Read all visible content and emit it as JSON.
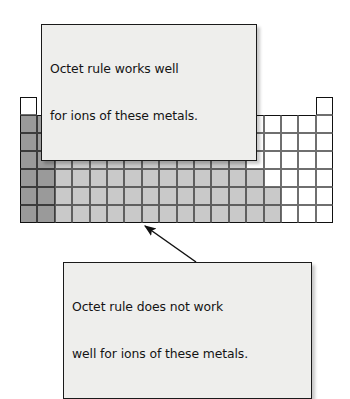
{
  "figure": {
    "background_color": "#ffffff"
  },
  "callouts": {
    "top": {
      "name": "octet-works-callout",
      "line1": "Octet rule works well",
      "line2": "for ions of these metals.",
      "fill_color": "#eeeeec",
      "border_color": "#1a1a1a",
      "text_color": "#141414"
    },
    "bottom": {
      "name": "octet-does-not-work-callout",
      "line1": "Octet rule does not work",
      "line2": "well for ions of these metals.",
      "fill_color": "#eeeeec",
      "border_color": "#1a1a1a",
      "text_color": "#141414"
    }
  },
  "arrows": [
    {
      "name": "arrow-to-group2",
      "from_callout": "top",
      "points_to": "group-2-alkaline-earth-metals",
      "x1": 94,
      "y1": 80,
      "x2": 52,
      "y2": 110,
      "color": "#111111"
    },
    {
      "name": "arrow-to-aluminum",
      "from_callout": "top",
      "points_to": "group-13-aluminum-cell",
      "x1": 182,
      "y1": 80,
      "x2": 229,
      "y2": 130,
      "color": "#111111"
    },
    {
      "name": "arrow-to-transition-metals",
      "from_callout": "bottom",
      "points_to": "transition-metals-block",
      "x1": 196,
      "y1": 262,
      "x2": 145,
      "y2": 226,
      "color": "#111111"
    }
  ],
  "legend": {
    "dark_gray": {
      "color": "#9a9a9a",
      "meaning": "Octet rule works well for ions of these metals"
    },
    "light_gray": {
      "color": "#c9c9c9",
      "meaning": "Octet rule does not work well for ions of these metals"
    },
    "white": {
      "color": "#ffffff",
      "meaning": "Nonmetals and other elements, not shaded"
    }
  },
  "chart_data": {
    "type": "heatmap",
    "xlabel": "Group",
    "ylabel": "Period",
    "columns": 18,
    "rows": 7,
    "cell_width": 17.4,
    "cell_height": 18.0,
    "categories": [
      "dark",
      "light",
      "white",
      "empty"
    ],
    "grid": [
      [
        "white",
        "empty",
        "empty",
        "empty",
        "empty",
        "empty",
        "empty",
        "empty",
        "empty",
        "empty",
        "empty",
        "empty",
        "empty",
        "empty",
        "empty",
        "empty",
        "empty",
        "white"
      ],
      [
        "dark",
        "dark",
        "empty",
        "empty",
        "empty",
        "empty",
        "empty",
        "empty",
        "empty",
        "empty",
        "empty",
        "empty",
        "white",
        "white",
        "white",
        "white",
        "white",
        "white"
      ],
      [
        "dark",
        "dark",
        "empty",
        "empty",
        "empty",
        "empty",
        "empty",
        "empty",
        "empty",
        "empty",
        "empty",
        "empty",
        "dark",
        "white",
        "white",
        "white",
        "white",
        "white"
      ],
      [
        "dark",
        "dark",
        "light",
        "light",
        "light",
        "light",
        "light",
        "light",
        "light",
        "light",
        "light",
        "light",
        "light",
        "white",
        "white",
        "white",
        "white",
        "white"
      ],
      [
        "dark",
        "dark",
        "light",
        "light",
        "light",
        "light",
        "light",
        "light",
        "light",
        "light",
        "light",
        "light",
        "light",
        "light",
        "white",
        "white",
        "white",
        "white"
      ],
      [
        "dark",
        "dark",
        "light",
        "light",
        "light",
        "light",
        "light",
        "light",
        "light",
        "light",
        "light",
        "light",
        "light",
        "light",
        "light",
        "white",
        "white",
        "white"
      ],
      [
        "dark",
        "dark",
        "light",
        "light",
        "light",
        "light",
        "light",
        "light",
        "light",
        "light",
        "light",
        "light",
        "light",
        "light",
        "light",
        "white",
        "white",
        "white"
      ]
    ]
  }
}
